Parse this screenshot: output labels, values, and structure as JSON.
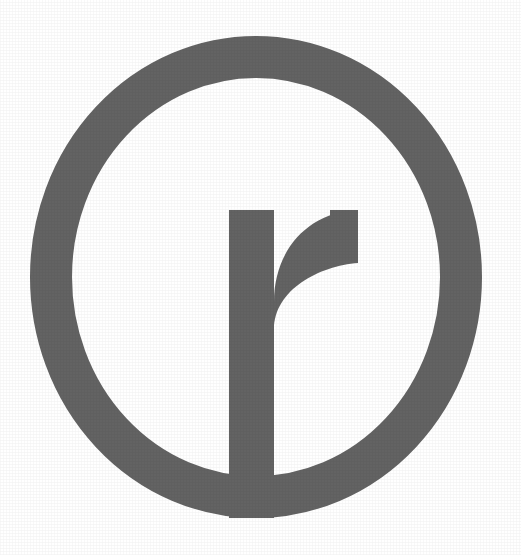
{
  "image": {
    "kind": "logo-mark",
    "alt_text": "Lowercase letter r enclosed in a circle outline",
    "letter": "r",
    "width": 521,
    "height": 555,
    "background_color": "#ffffff",
    "mark_color": "#636363",
    "mark_color_secondary": "#6b6b6b",
    "texture": "subtle paper grain"
  },
  "geometry": {
    "circle": {
      "center_x": 256,
      "center_y": 274,
      "outer_radius": 226,
      "stroke_width": 42,
      "mid_radius": 205,
      "outer_left_x": 30,
      "outer_right_x": 482,
      "outer_top_y": 36,
      "outer_bottom_y": 518
    },
    "letter_r": {
      "stem_left_x": 229,
      "stem_right_x": 274,
      "stem_top_y": 210,
      "stem_bottom_y": 518,
      "stem_width": 45,
      "arm_terminal_x": 358,
      "arm_terminal_bottom_y": 263,
      "arm_top_y": 210
    }
  },
  "labels": {
    "title": "r",
    "caption": ""
  }
}
